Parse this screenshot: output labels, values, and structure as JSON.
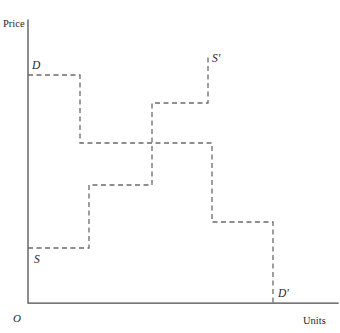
{
  "chart_data": {
    "type": "line",
    "title": "",
    "subtitle": "",
    "xlabel": "Units",
    "ylabel": "Price",
    "origin_label": "O",
    "grid": false,
    "legend": "none",
    "axis_ranges": {
      "x_pixels": [
        28,
        338
      ],
      "y_pixels": [
        303,
        20
      ]
    },
    "annotations": [
      {
        "name": "demand-start",
        "text": "D",
        "x": 31,
        "y": 68
      },
      {
        "name": "demand-end",
        "text": "D'",
        "x": 279,
        "y": 296
      },
      {
        "name": "supply-start",
        "text": "S",
        "x": 36,
        "y": 262
      },
      {
        "name": "supply-end",
        "text": "S'",
        "x": 214,
        "y": 62
      }
    ],
    "series": [
      {
        "name": "D",
        "label": "Demand",
        "style": "dashed-step",
        "color": "#6b6b6b",
        "start_label": "D",
        "end_label": "D'",
        "direction": "descending",
        "steps": [
          {
            "price_level": 75,
            "from_unit": 28,
            "to_unit": 80
          },
          {
            "price_level": 143,
            "from_unit": 80,
            "to_unit": 212
          },
          {
            "price_level": 222,
            "from_unit": 212,
            "to_unit": 273
          },
          {
            "price_level": 303,
            "from_unit": 273,
            "to_unit": 273
          }
        ],
        "path": "M28,75 L80,75 L80,143 L212,143 L212,222 L273,222 L273,303"
      },
      {
        "name": "S",
        "label": "Supply",
        "style": "dashed-step",
        "color": "#6b6b6b",
        "start_label": "S",
        "end_label": "S'",
        "direction": "ascending",
        "steps": [
          {
            "price_level": 248,
            "from_unit": 28,
            "to_unit": 89
          },
          {
            "price_level": 185,
            "from_unit": 89,
            "to_unit": 152
          },
          {
            "price_level": 103,
            "from_unit": 152,
            "to_unit": 208
          },
          {
            "price_level": 57,
            "from_unit": 208,
            "to_unit": 208
          }
        ],
        "path": "M28,248 L89,248 L89,185 L152,185 L152,103 L208,103 L208,57"
      }
    ],
    "axes_path": "M28,20 L28,303 L338,303"
  },
  "labels": {
    "price": "Price",
    "units": "Units",
    "origin": "O",
    "demand": "D",
    "demand_prime": "D'",
    "supply": "S",
    "supply_prime": "S'"
  },
  "colors": {
    "axis": "#4a4a4a",
    "curve": "#6b6b6b",
    "text": "#262626",
    "background": "#ffffff"
  }
}
